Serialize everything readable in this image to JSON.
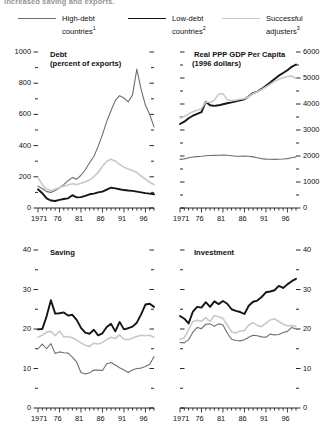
{
  "caption": "increased saving and exports.",
  "legend": {
    "items": [
      {
        "label": "High-debt",
        "label2": "countries",
        "note": "1",
        "color": "#6e6e6e",
        "width": 1.1
      },
      {
        "label": "Low-debt",
        "label2": "countries",
        "note": "2",
        "color": "#151515",
        "width": 1.9
      },
      {
        "label": "Successful",
        "label2": "adjusters",
        "note": "3",
        "color": "#c9c9c9",
        "width": 1.6
      }
    ]
  },
  "chart_data": [
    {
      "type": "line",
      "id": "debt",
      "title": "Debt",
      "subtitle": "(percent of exports)",
      "xlabel": "",
      "ylabel": "",
      "ylim": [
        0,
        1000
      ],
      "yticks": [
        0,
        200,
        400,
        600,
        800,
        1000
      ],
      "yticklabels": [
        "0",
        "200",
        "400",
        "600",
        "800",
        "1000"
      ],
      "y_axis_side": "left",
      "xlim": [
        1971,
        1998
      ],
      "xticks": [
        1971,
        1976,
        1981,
        1986,
        1991,
        1996
      ],
      "xticklabels": [
        "1971",
        "76",
        "81",
        "86",
        "91",
        "96"
      ],
      "grid": false,
      "x": [
        1971,
        1972,
        1973,
        1974,
        1975,
        1976,
        1977,
        1978,
        1979,
        1980,
        1981,
        1982,
        1983,
        1984,
        1985,
        1986,
        1987,
        1988,
        1989,
        1990,
        1991,
        1992,
        1993,
        1994,
        1995,
        1996,
        1997,
        1998
      ],
      "series": [
        {
          "name": "High-debt countries",
          "color": "#6e6e6e",
          "width": 1.1,
          "values": [
            140,
            125,
            105,
            100,
            112,
            130,
            150,
            175,
            195,
            185,
            210,
            245,
            290,
            330,
            395,
            470,
            555,
            625,
            690,
            720,
            705,
            680,
            725,
            890,
            760,
            660,
            600,
            520
          ]
        },
        {
          "name": "Low-debt countries",
          "color": "#151515",
          "width": 1.9,
          "values": [
            120,
            95,
            62,
            48,
            45,
            52,
            58,
            62,
            82,
            68,
            70,
            78,
            88,
            92,
            100,
            105,
            118,
            130,
            126,
            120,
            115,
            112,
            110,
            105,
            100,
            95,
            92,
            88
          ]
        },
        {
          "name": "Successful adjusters",
          "color": "#c9c9c9",
          "width": 1.6,
          "values": [
            195,
            150,
            120,
            112,
            120,
            132,
            140,
            148,
            155,
            150,
            158,
            168,
            180,
            200,
            228,
            268,
            300,
            312,
            300,
            280,
            262,
            250,
            240,
            228,
            205,
            185,
            165,
            150
          ]
        }
      ]
    },
    {
      "type": "line",
      "id": "gdp",
      "title": "Real PPP GDP Per Capita",
      "subtitle": "(1996 dollars)",
      "xlabel": "",
      "ylabel": "",
      "ylim": [
        0,
        6000
      ],
      "yticks": [
        0,
        1000,
        2000,
        3000,
        4000,
        5000,
        6000
      ],
      "yticklabels": [
        "0",
        "1000",
        "2000",
        "3000",
        "4000",
        "5000",
        "6000"
      ],
      "y_axis_side": "right",
      "xlim": [
        1971,
        1998
      ],
      "xticks": [
        1971,
        1976,
        1981,
        1986,
        1991,
        1996
      ],
      "xticklabels": [
        "1971",
        "76",
        "81",
        "86",
        "91",
        "96"
      ],
      "grid": false,
      "x": [
        1971,
        1972,
        1973,
        1974,
        1975,
        1976,
        1977,
        1978,
        1979,
        1980,
        1981,
        1982,
        1983,
        1984,
        1985,
        1986,
        1987,
        1988,
        1989,
        1990,
        1991,
        1992,
        1993,
        1994,
        1995,
        1996,
        1997,
        1998
      ],
      "series": [
        {
          "name": "High-debt countries",
          "color": "#6e6e6e",
          "width": 1.1,
          "values": [
            1870,
            1890,
            1930,
            1960,
            1975,
            1990,
            2010,
            2020,
            2025,
            2030,
            2035,
            2030,
            2010,
            1990,
            1990,
            1995,
            1990,
            1965,
            1930,
            1900,
            1880,
            1875,
            1870,
            1875,
            1885,
            1900,
            1930,
            1965
          ]
        },
        {
          "name": "Low-debt countries",
          "color": "#151515",
          "width": 1.9,
          "values": [
            3230,
            3320,
            3450,
            3550,
            3620,
            3690,
            4090,
            3950,
            3930,
            3950,
            3990,
            4030,
            4060,
            4100,
            4140,
            4180,
            4300,
            4420,
            4480,
            4580,
            4700,
            4830,
            4960,
            5090,
            5190,
            5300,
            5430,
            5520
          ]
        },
        {
          "name": "Successful adjusters",
          "color": "#c9c9c9",
          "width": 1.6,
          "values": [
            3450,
            3520,
            3620,
            3700,
            3760,
            3820,
            4080,
            4060,
            4150,
            4380,
            4400,
            4160,
            4130,
            4150,
            4180,
            4200,
            4290,
            4400,
            4470,
            4560,
            4660,
            4760,
            4860,
            4950,
            5010,
            5060,
            5080,
            4980
          ]
        }
      ]
    },
    {
      "type": "line",
      "id": "saving",
      "title": "Saving",
      "subtitle": "",
      "xlabel": "",
      "ylabel": "",
      "ylim": [
        0,
        40
      ],
      "yticks": [
        0,
        10,
        20,
        30,
        40
      ],
      "yticklabels": [
        "0",
        "10",
        "20",
        "30",
        "40"
      ],
      "y_axis_side": "left",
      "xlim": [
        1971,
        1998
      ],
      "xticks": [
        1971,
        1976,
        1981,
        1986,
        1991,
        1996
      ],
      "xticklabels": [
        "1971",
        "76",
        "81",
        "86",
        "91",
        "96"
      ],
      "grid": false,
      "x": [
        1971,
        1972,
        1973,
        1974,
        1975,
        1976,
        1977,
        1978,
        1979,
        1980,
        1981,
        1982,
        1983,
        1984,
        1985,
        1986,
        1987,
        1988,
        1989,
        1990,
        1991,
        1992,
        1993,
        1994,
        1995,
        1996,
        1997,
        1998
      ],
      "series": [
        {
          "name": "High-debt countries",
          "color": "#6e6e6e",
          "width": 1.1,
          "values": [
            15.0,
            16.2,
            15.0,
            16.3,
            13.8,
            14.2,
            14.0,
            13.9,
            12.9,
            11.6,
            9.0,
            8.6,
            8.9,
            9.6,
            9.6,
            9.5,
            11.2,
            11.5,
            10.9,
            10.2,
            9.6,
            9.0,
            9.6,
            10.0,
            10.1,
            10.5,
            11.1,
            13.0
          ]
        },
        {
          "name": "Low-debt countries",
          "color": "#151515",
          "width": 1.9,
          "values": [
            19.9,
            20.0,
            23.2,
            27.3,
            23.9,
            24.0,
            24.2,
            23.4,
            23.6,
            22.3,
            20.3,
            19.1,
            18.8,
            19.8,
            18.4,
            18.9,
            20.5,
            21.3,
            19.4,
            21.8,
            19.9,
            20.2,
            20.6,
            21.6,
            23.7,
            26.2,
            26.4,
            25.6
          ]
        },
        {
          "name": "Successful adjusters",
          "color": "#c9c9c9",
          "width": 1.6,
          "values": [
            18.0,
            18.4,
            19.2,
            19.4,
            18.3,
            19.5,
            18.0,
            18.1,
            17.8,
            17.2,
            16.5,
            15.9,
            15.6,
            16.4,
            16.2,
            16.6,
            17.4,
            17.9,
            17.6,
            18.5,
            17.4,
            17.3,
            17.7,
            18.1,
            18.4,
            18.3,
            18.4,
            17.9
          ]
        }
      ]
    },
    {
      "type": "line",
      "id": "investment",
      "title": "Investment",
      "subtitle": "",
      "xlabel": "",
      "ylabel": "",
      "ylim": [
        0,
        40
      ],
      "yticks": [
        0,
        10,
        20,
        30,
        40
      ],
      "yticklabels": [
        "0",
        "10",
        "20",
        "30",
        "40"
      ],
      "y_axis_side": "right",
      "xlim": [
        1971,
        1998
      ],
      "xticks": [
        1971,
        1976,
        1981,
        1986,
        1991,
        1996
      ],
      "xticklabels": [
        "1971",
        "76",
        "81",
        "86",
        "91",
        "96"
      ],
      "grid": false,
      "x": [
        1971,
        1972,
        1973,
        1974,
        1975,
        1976,
        1977,
        1978,
        1979,
        1980,
        1981,
        1982,
        1983,
        1984,
        1985,
        1986,
        1987,
        1988,
        1989,
        1990,
        1991,
        1992,
        1993,
        1994,
        1995,
        1996,
        1997,
        1998
      ],
      "series": [
        {
          "name": "High-debt countries",
          "color": "#6e6e6e",
          "width": 1.1,
          "values": [
            16.6,
            16.5,
            17.3,
            19.2,
            20.4,
            20.1,
            21.2,
            21.3,
            20.7,
            21.3,
            21.0,
            19.0,
            17.4,
            17.1,
            17.0,
            17.3,
            17.9,
            18.4,
            18.3,
            18.0,
            17.9,
            18.7,
            18.5,
            18.6,
            19.1,
            19.4,
            20.4,
            20.0
          ]
        },
        {
          "name": "Low-debt countries",
          "color": "#151515",
          "width": 1.9,
          "values": [
            23.3,
            22.6,
            21.4,
            24.4,
            25.6,
            25.4,
            26.8,
            25.6,
            27.0,
            26.3,
            27.1,
            26.4,
            25.0,
            24.6,
            24.3,
            23.8,
            25.9,
            26.9,
            27.2,
            28.1,
            29.3,
            29.5,
            29.8,
            30.9,
            30.4,
            31.3,
            32.1,
            32.7
          ]
        },
        {
          "name": "Successful adjusters",
          "color": "#c9c9c9",
          "width": 1.6,
          "values": [
            17.4,
            17.8,
            19.8,
            21.9,
            22.2,
            22.0,
            22.9,
            21.9,
            23.4,
            23.1,
            22.7,
            21.0,
            19.3,
            19.0,
            19.5,
            19.6,
            21.0,
            21.6,
            20.9,
            20.6,
            21.5,
            22.3,
            22.6,
            21.9,
            21.2,
            20.8,
            20.9,
            20.6
          ]
        }
      ]
    }
  ]
}
